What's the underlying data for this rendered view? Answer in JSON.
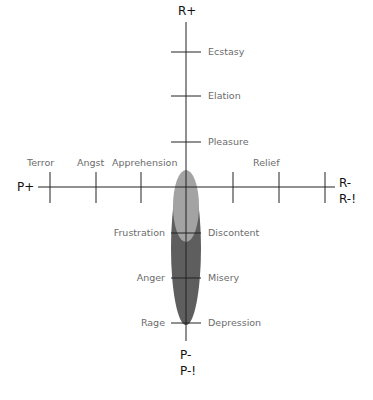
{
  "diagram": {
    "axes": {
      "top": "R+",
      "left": "P+",
      "right_1": "R-",
      "right_2": "R-!",
      "bottom_1": "P-",
      "bottom_2": "P-!"
    },
    "labels": {
      "ecstasy": "Ecstasy",
      "elation": "Elation",
      "pleasure": "Pleasure",
      "terror": "Terror",
      "angst": "Angst",
      "apprehension": "Apprehension",
      "relief": "Relief",
      "frustration": "Frustration",
      "discontent": "Discontent",
      "anger": "Anger",
      "misery": "Misery",
      "rage": "Rage",
      "depression": "Depression"
    },
    "colors": {
      "axis": "#222222",
      "label": "#6b6b6b",
      "ellipse_dark": "#5e5e5e",
      "ellipse_light": "#a3a3a3"
    }
  }
}
